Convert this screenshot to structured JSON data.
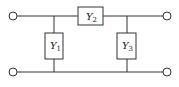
{
  "diagram": {
    "type": "pi-network circuit",
    "elements": [
      {
        "id": "Y1",
        "label": "Y",
        "sub": "1",
        "position": "left shunt"
      },
      {
        "id": "Y2",
        "label": "Y",
        "sub": "2",
        "position": "series top"
      },
      {
        "id": "Y3",
        "label": "Y",
        "sub": "3",
        "position": "right shunt"
      }
    ],
    "terminals": [
      "top-left",
      "bottom-left",
      "top-right",
      "bottom-right"
    ],
    "colors": {
      "line": "#333333",
      "box_fill": "#ffffff"
    }
  }
}
